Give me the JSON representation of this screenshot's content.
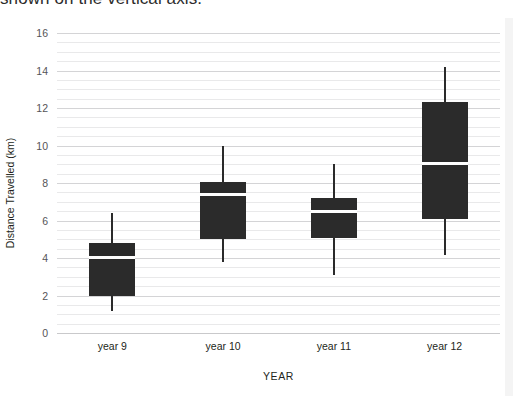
{
  "caption": {
    "text": "shown on the vertical axis."
  },
  "chart_data": {
    "type": "box",
    "title": "",
    "xlabel": "YEAR",
    "ylabel": "Distance Travelled (km)",
    "categories": [
      "year 9",
      "year 10",
      "year 11",
      "year 12"
    ],
    "ylim": [
      0,
      16
    ],
    "yticks": [
      0,
      2,
      4,
      6,
      8,
      10,
      12,
      14,
      16
    ],
    "ytick_labels": [
      "0",
      "2",
      "4",
      "6",
      "8",
      "10",
      "12",
      "14",
      "16"
    ],
    "minor_gridline_step": 0.5,
    "grid": true,
    "legend": "none",
    "box_color": "#2b2b2b",
    "median_color": "#ffffff",
    "gridline_color": "#e9e9ea",
    "boxes": [
      {
        "category": "year 9",
        "min": 1.2,
        "q1": 2.0,
        "median": 4.05,
        "q3": 4.8,
        "max": 6.4
      },
      {
        "category": "year 10",
        "min": 3.8,
        "q1": 5.0,
        "median": 7.4,
        "q3": 8.05,
        "max": 10.0
      },
      {
        "category": "year 11",
        "min": 3.1,
        "q1": 5.05,
        "median": 6.5,
        "q3": 7.2,
        "max": 9.0
      },
      {
        "category": "year 12",
        "min": 4.15,
        "q1": 6.1,
        "median": 9.05,
        "q3": 12.3,
        "max": 14.2
      }
    ]
  }
}
